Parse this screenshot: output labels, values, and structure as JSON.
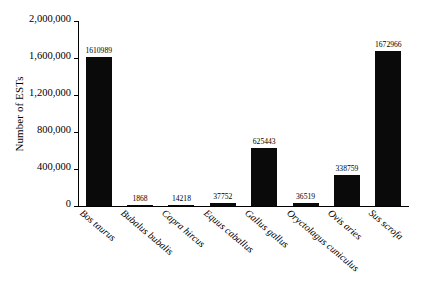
{
  "chart_data": {
    "type": "bar",
    "title": "",
    "subtitle": "",
    "xlabel": "",
    "ylabel": "Number of ESTs",
    "ylim": [
      0,
      2000000
    ],
    "ytick_labels": [
      "0",
      "400,000",
      "800,000",
      "1,200,000",
      "1,600,000",
      "2,000,000"
    ],
    "ytick_values": [
      0,
      400000,
      800000,
      1200000,
      1600000,
      2000000
    ],
    "grid": false,
    "legend": false,
    "bar_color": "#0a0a0a",
    "categories": [
      "Bos taurus",
      "Bubalus bubalis",
      "Capra hircus",
      "Equus caballus",
      "Gallus gallus",
      "Oryctolagus cuniculus",
      "Ovis aries",
      "Sus scrofa"
    ],
    "values": [
      1610989,
      1868,
      14218,
      37752,
      625443,
      36519,
      338759,
      1672966
    ],
    "value_labels": [
      "1610989",
      "1868",
      "14218",
      "37752",
      "625443",
      "36519",
      "338759",
      "1672966"
    ]
  }
}
